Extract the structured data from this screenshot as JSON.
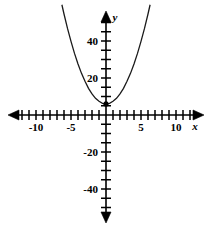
{
  "figure": {
    "background_color": "#ffffff",
    "line_color": "#000000",
    "curve_color": "#1a1a1a",
    "width": 213,
    "height": 233
  },
  "axes": {
    "x_axis_name": "x",
    "y_axis_name": "y",
    "origin_px": {
      "x": 106,
      "y": 115
    },
    "px_per_unit_x": 7.0,
    "px_per_unit_y": 1.85,
    "x_tick_labels": [
      "-10",
      "-5",
      "5",
      "10"
    ],
    "x_tick_values": [
      -10,
      -5,
      5,
      10
    ],
    "y_tick_labels": [
      "40",
      "20",
      "-20",
      "-40"
    ],
    "y_tick_values": [
      40,
      20,
      -20,
      -40
    ],
    "x_tick_step": 1,
    "y_tick_step": 5,
    "x_tick_min": -13,
    "x_tick_max": 13,
    "y_tick_min": -50,
    "y_tick_max": 50,
    "arrows": [
      "left",
      "right",
      "up",
      "down"
    ],
    "grid": false
  },
  "chart_data": {
    "type": "line",
    "title": "",
    "xlabel": "x",
    "ylabel": "y",
    "xlim": [
      -13,
      13
    ],
    "ylim": [
      -50,
      50
    ],
    "grid": false,
    "legend": null,
    "annotations": [
      {
        "label": "vertex",
        "x": 0,
        "y": 6,
        "marker": "dot"
      }
    ],
    "series": [
      {
        "name": "parabola",
        "equation": "y = 1.35x^2 + 6",
        "x": [
          -6.3,
          -6.0,
          -5.5,
          -5.0,
          -4.5,
          -4.0,
          -3.5,
          -3.0,
          -2.5,
          -2.0,
          -1.5,
          -1.0,
          -0.5,
          0.0,
          0.5,
          1.0,
          1.5,
          2.0,
          2.5,
          3.0,
          3.5,
          4.0,
          4.5,
          5.0,
          5.5,
          6.0,
          6.3
        ],
        "values": [
          59.6,
          54.6,
          46.8,
          39.8,
          33.3,
          27.6,
          22.5,
          18.2,
          14.4,
          11.4,
          9.0,
          7.4,
          6.3,
          6.0,
          6.3,
          7.4,
          9.0,
          11.4,
          14.4,
          18.2,
          22.5,
          27.6,
          33.3,
          39.8,
          46.8,
          54.6,
          59.6
        ]
      }
    ]
  }
}
